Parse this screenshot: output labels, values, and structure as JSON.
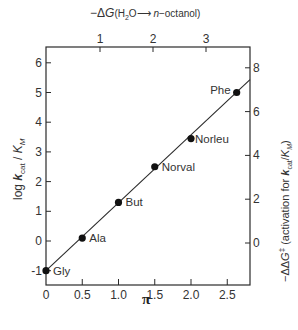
{
  "chart_data": {
    "type": "scatter",
    "title": "",
    "xlabel": "π",
    "ylabel": "log k_cat/K_M",
    "top_xlabel": "−ΔG(H2O → n-octanol)",
    "right_ylabel": "−ΔΔG‡ (activation for k_cat/K_M)",
    "xlim": [
      0,
      2.8
    ],
    "ylim": [
      -1.5,
      6.6
    ],
    "x_ticks": [
      0,
      0.5,
      1.0,
      1.5,
      2.0,
      2.5
    ],
    "x_tick_labels": [
      "0",
      "0.5",
      "1.0",
      "1.5",
      "2.0",
      "2.5"
    ],
    "y_ticks": [
      -1,
      0,
      1,
      2,
      3,
      4,
      5,
      6
    ],
    "y_tick_labels": [
      "-1",
      "0",
      "1",
      "2",
      "3",
      "4",
      "5",
      "6"
    ],
    "top_ticks": [
      1,
      2,
      3
    ],
    "top_tick_labels": [
      "1",
      "2",
      "3"
    ],
    "right_ticks": [
      0,
      2,
      4,
      6,
      8
    ],
    "right_tick_labels": [
      "0",
      "2",
      "4",
      "6",
      "8"
    ],
    "grid": false,
    "legend": null,
    "series": [
      {
        "name": "amino acid substrates",
        "points": [
          {
            "label": "Gly",
            "x": 0.0,
            "y": -1.0
          },
          {
            "label": "Ala",
            "x": 0.5,
            "y": 0.1
          },
          {
            "label": "But",
            "x": 1.0,
            "y": 1.3
          },
          {
            "label": "Norval",
            "x": 1.5,
            "y": 2.5
          },
          {
            "label": "Norleu",
            "x": 2.0,
            "y": 3.45
          },
          {
            "label": "Phe",
            "x": 2.63,
            "y": 5.0
          }
        ]
      }
    ],
    "fit_line": {
      "x": [
        0.0,
        2.8
      ],
      "y": [
        -1.0,
        5.4
      ]
    }
  }
}
